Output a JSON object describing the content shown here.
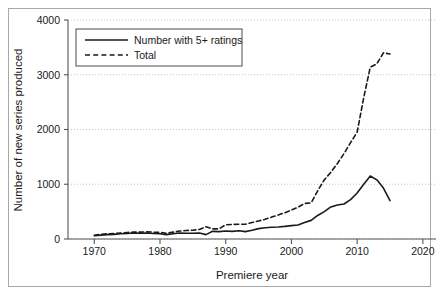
{
  "chart_data": {
    "type": "line",
    "title": "",
    "xlabel": "Premiere year",
    "ylabel": "Number of new series produced",
    "xlim": [
      1966,
      2022
    ],
    "ylim": [
      0,
      4000
    ],
    "grid": true,
    "legend_position": "top-left",
    "xticks": [
      1970,
      1980,
      1990,
      2000,
      2010,
      2020
    ],
    "yticks": [
      0,
      1000,
      2000,
      3000,
      4000
    ],
    "x": [
      1970,
      1971,
      1972,
      1973,
      1974,
      1975,
      1976,
      1977,
      1978,
      1979,
      1980,
      1981,
      1982,
      1983,
      1984,
      1985,
      1986,
      1987,
      1988,
      1989,
      1990,
      1991,
      1992,
      1993,
      1994,
      1995,
      1996,
      1997,
      1998,
      1999,
      2000,
      2001,
      2002,
      2003,
      2004,
      2005,
      2006,
      2007,
      2008,
      2009,
      2010,
      2011,
      2012,
      2013,
      2014,
      2015
    ],
    "series": [
      {
        "name": "Number with 5+ ratings",
        "style": "solid",
        "color": "#1a1a1a",
        "values": [
          60,
          70,
          80,
          85,
          95,
          100,
          110,
          105,
          110,
          100,
          95,
          80,
          95,
          110,
          105,
          105,
          110,
          80,
          140,
          135,
          145,
          140,
          150,
          135,
          160,
          190,
          205,
          215,
          220,
          230,
          245,
          255,
          300,
          340,
          430,
          500,
          585,
          620,
          640,
          720,
          840,
          1000,
          1150,
          1080,
          930,
          700
        ]
      },
      {
        "name": "Total",
        "style": "dashed",
        "color": "#1a1a1a",
        "values": [
          70,
          85,
          95,
          100,
          110,
          120,
          125,
          125,
          130,
          125,
          120,
          105,
          125,
          145,
          155,
          160,
          175,
          225,
          185,
          185,
          260,
          265,
          270,
          270,
          300,
          330,
          360,
          400,
          440,
          480,
          530,
          580,
          650,
          660,
          880,
          1080,
          1220,
          1380,
          1560,
          1760,
          1950,
          2580,
          3140,
          3200,
          3400,
          3380
        ]
      }
    ]
  },
  "legend": {
    "entries": [
      {
        "label": "Number with 5+ ratings",
        "style": "solid"
      },
      {
        "label": "Total",
        "style": "dashed"
      }
    ]
  },
  "axes": {
    "x_title": "Premiere year",
    "y_title": "Number of new series produced",
    "x_tick_labels": [
      "1970",
      "1980",
      "1990",
      "2000",
      "2010",
      "2020"
    ],
    "y_tick_labels": [
      "0",
      "1000",
      "2000",
      "3000",
      "4000"
    ]
  },
  "colors": {
    "line": "#1a1a1a",
    "grid": "#b9b9b9",
    "axis": "#555555",
    "frame": "#a8a8a8",
    "background": "#ffffff"
  }
}
